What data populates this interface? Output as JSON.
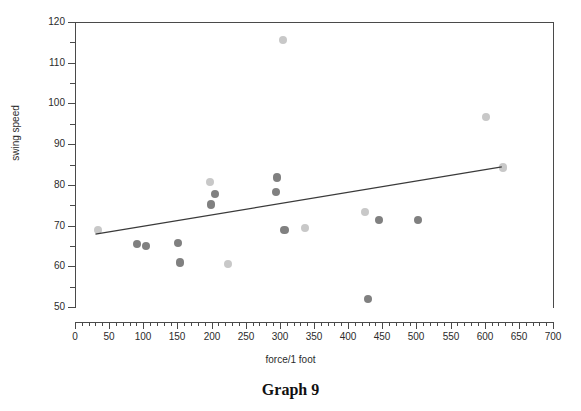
{
  "caption": "Graph 9",
  "chart_data": {
    "type": "scatter",
    "title": "",
    "xlabel": "force/1 foot",
    "ylabel": "swing speed",
    "xlim": [
      0,
      700
    ],
    "ylim": [
      50,
      120
    ],
    "xticks": [
      0,
      50,
      100,
      150,
      200,
      250,
      300,
      350,
      400,
      450,
      500,
      550,
      600,
      650,
      700
    ],
    "yticks": [
      50,
      60,
      70,
      80,
      90,
      100,
      110,
      120
    ],
    "xtick_minor_step": 10,
    "ytick_minor_step": 5,
    "grid": false,
    "legend": "none",
    "marker_colors": {
      "dark": "#808080",
      "light": "#c8c8c8"
    },
    "series": [
      {
        "name": "dark markers",
        "color": "#808080",
        "points": [
          {
            "x": 91,
            "y": 65.5
          },
          {
            "x": 104,
            "y": 65.0
          },
          {
            "x": 151,
            "y": 65.7
          },
          {
            "x": 154,
            "y": 60.9
          },
          {
            "x": 205,
            "y": 77.7
          },
          {
            "x": 199,
            "y": 75.2
          },
          {
            "x": 296,
            "y": 81.8
          },
          {
            "x": 294,
            "y": 78.2
          },
          {
            "x": 307,
            "y": 68.9
          },
          {
            "x": 445,
            "y": 71.4
          },
          {
            "x": 502,
            "y": 71.4
          },
          {
            "x": 429,
            "y": 52.0
          }
        ]
      },
      {
        "name": "light markers",
        "color": "#c8c8c8",
        "points": [
          {
            "x": 34,
            "y": 68.9
          },
          {
            "x": 198,
            "y": 80.7
          },
          {
            "x": 224,
            "y": 60.6
          },
          {
            "x": 337,
            "y": 69.4
          },
          {
            "x": 425,
            "y": 73.4
          },
          {
            "x": 305,
            "y": 115.6
          },
          {
            "x": 602,
            "y": 96.6
          },
          {
            "x": 627,
            "y": 84.3
          }
        ]
      }
    ],
    "trendline": {
      "name": "linear fit",
      "color": "#3a3a3a",
      "x_start": 30,
      "y_start": 67.9,
      "x_end": 625,
      "y_end": 84.4
    }
  },
  "axis_tick_labels": {
    "x": [
      "0",
      "50",
      "100",
      "150",
      "200",
      "250",
      "300",
      "350",
      "400",
      "450",
      "500",
      "550",
      "600",
      "650",
      "700"
    ],
    "y": [
      "50",
      "60",
      "70",
      "80",
      "90",
      "100",
      "110",
      "120"
    ]
  }
}
